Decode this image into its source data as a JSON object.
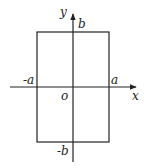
{
  "diagram": {
    "type": "coordinate-rectangle",
    "axes": {
      "x_label": "x",
      "y_label": "y",
      "origin_label": "o"
    },
    "labels": {
      "neg_a": "-a",
      "pos_a": "a",
      "pos_b": "b",
      "neg_b": "-b"
    },
    "rectangle": {
      "x_range": [
        "-a",
        "a"
      ],
      "y_range": [
        "-b",
        "b"
      ]
    },
    "colors": {
      "stroke": "#222222",
      "background": "#ffffff"
    }
  }
}
